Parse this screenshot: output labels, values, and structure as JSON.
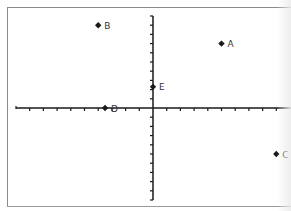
{
  "chart_data": {
    "type": "scatter",
    "title": "",
    "xlabel": "",
    "ylabel": "",
    "grid": false,
    "legend": null,
    "xlim": [
      -10,
      10
    ],
    "ylim": [
      -10,
      10
    ],
    "axes_through_origin": true,
    "tick_spacing": 1,
    "tick_labels_visible": false,
    "points": [
      {
        "label": "A",
        "x": 5,
        "y": 7
      },
      {
        "label": "B",
        "x": -4,
        "y": 9
      },
      {
        "label": "C",
        "x": 9,
        "y": -5
      },
      {
        "label": "D",
        "x": -3.5,
        "y": 0
      },
      {
        "label": "E",
        "x": 0,
        "y": 2.3
      }
    ]
  },
  "style": {
    "axis_color": "#1a1a1a",
    "marker_color": "#1a1a1a",
    "label_color": "#333333",
    "frame_color": "#8a8a8a"
  },
  "layout": {
    "origin_px": [
      153,
      108
    ],
    "unit_x_px": 13.7,
    "unit_y_px": 9.2,
    "x_axis_px": [
      16,
      291
    ],
    "y_axis_px": [
      16,
      200
    ]
  }
}
